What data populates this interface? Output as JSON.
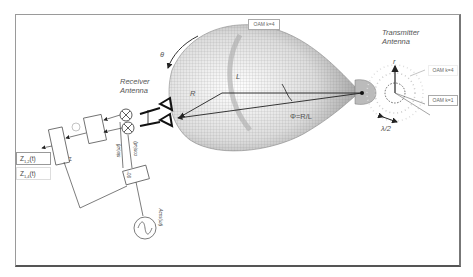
{
  "diagram": {
    "labels": {
      "theta": "θ",
      "receiver_antenna": [
        "Receiver",
        "Antenna"
      ],
      "transmitter_antenna": [
        "Transmitter",
        "Antenna"
      ],
      "R": "R",
      "L": "L",
      "phi_relation": "Φ=R/L",
      "r": "r",
      "half_lambda": "λ/2",
      "delta": "δ"
    },
    "oam_boxes": {
      "top": "OAM k=4",
      "tx_upper": "OAM k=4",
      "tx_lower": "OAM k=1"
    },
    "signals": {
      "z1": "Z",
      "z1_sub": "1,2",
      "z1_suffix": "(t)",
      "z2": "Z",
      "z2_sub": "1,4",
      "z2_suffix": "(t)"
    },
    "circuit_labels": {
      "sin": "sin(ωt)",
      "cos": "cos(ωt)",
      "oscillator": "Acos(ωt)",
      "phase_shift": "90°",
      "sum": "Σ"
    }
  }
}
